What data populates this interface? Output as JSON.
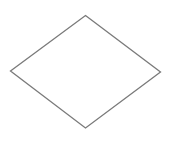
{
  "diagram": {
    "shape": "diamond",
    "stroke_color": "#7a7a7a",
    "fill_color": "#ffffff",
    "stroke_width": "1.3",
    "points": "85.5,15.5 160.5,72 85.5,128 10.5,71"
  }
}
